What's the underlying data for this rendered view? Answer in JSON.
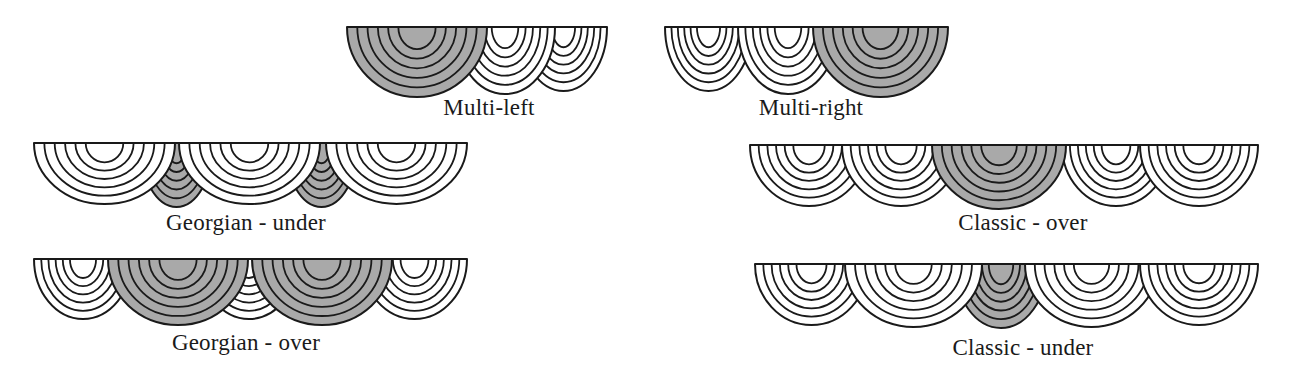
{
  "colors": {
    "shade": "#a9a9a9",
    "plain": "#ffffff",
    "stroke": "#1a1a1a"
  },
  "arcs_per_swag": 6,
  "diagrams": [
    {
      "id": "multi-left",
      "label": "Multi-left",
      "label_x": 489,
      "label_y": 95,
      "top": 27,
      "swags": [
        {
          "x1": 520,
          "x2": 607,
          "depth": 64,
          "shaded": false
        },
        {
          "x1": 455,
          "x2": 555,
          "depth": 67,
          "shaded": false
        },
        {
          "x1": 347,
          "x2": 487,
          "depth": 70,
          "shaded": true
        }
      ]
    },
    {
      "id": "multi-right",
      "label": "Multi-right",
      "label_x": 811,
      "label_y": 95,
      "top": 27,
      "swags": [
        {
          "x1": 665,
          "x2": 752,
          "depth": 64,
          "shaded": false
        },
        {
          "x1": 738,
          "x2": 838,
          "depth": 67,
          "shaded": false
        },
        {
          "x1": 813,
          "x2": 948,
          "depth": 70,
          "shaded": true
        }
      ]
    },
    {
      "id": "georgian-under",
      "label": "Georgian - under",
      "label_x": 246,
      "label_y": 210,
      "top": 143,
      "swags": [
        {
          "x1": 140,
          "x2": 213,
          "depth": 64,
          "shaded": true
        },
        {
          "x1": 285,
          "x2": 358,
          "depth": 64,
          "shaded": true
        },
        {
          "x1": 34,
          "x2": 175,
          "depth": 61,
          "shaded": false
        },
        {
          "x1": 179,
          "x2": 320,
          "depth": 61,
          "shaded": false
        },
        {
          "x1": 326,
          "x2": 467,
          "depth": 61,
          "shaded": false
        }
      ]
    },
    {
      "id": "georgian-over",
      "label": "Georgian - over",
      "label_x": 246,
      "label_y": 330,
      "top": 259,
      "swags": [
        {
          "x1": 34,
          "x2": 132,
          "depth": 60,
          "shaded": false
        },
        {
          "x1": 200,
          "x2": 298,
          "depth": 60,
          "shaded": false
        },
        {
          "x1": 362,
          "x2": 467,
          "depth": 60,
          "shaded": false
        },
        {
          "x1": 108,
          "x2": 248,
          "depth": 66,
          "shaded": true
        },
        {
          "x1": 252,
          "x2": 392,
          "depth": 66,
          "shaded": true
        }
      ]
    },
    {
      "id": "classic-over",
      "label": "Classic - over",
      "label_x": 1023,
      "label_y": 210,
      "top": 145,
      "swags": [
        {
          "x1": 750,
          "x2": 868,
          "depth": 61,
          "shaded": false
        },
        {
          "x1": 842,
          "x2": 960,
          "depth": 61,
          "shaded": false
        },
        {
          "x1": 1062,
          "x2": 1170,
          "depth": 61,
          "shaded": false
        },
        {
          "x1": 1140,
          "x2": 1258,
          "depth": 61,
          "shaded": false
        },
        {
          "x1": 932,
          "x2": 1066,
          "depth": 64,
          "shaded": true
        }
      ]
    },
    {
      "id": "classic-under",
      "label": "Classic - under",
      "label_x": 1023,
      "label_y": 335,
      "top": 264,
      "swags": [
        {
          "x1": 955,
          "x2": 1047,
          "depth": 64,
          "shaded": true
        },
        {
          "x1": 755,
          "x2": 868,
          "depth": 61,
          "shaded": false
        },
        {
          "x1": 845,
          "x2": 982,
          "depth": 63,
          "shaded": false
        },
        {
          "x1": 1025,
          "x2": 1158,
          "depth": 63,
          "shaded": false
        },
        {
          "x1": 1140,
          "x2": 1258,
          "depth": 61,
          "shaded": false
        }
      ]
    }
  ]
}
